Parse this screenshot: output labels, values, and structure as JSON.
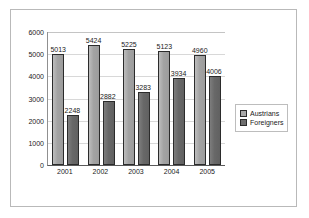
{
  "chart_data": {
    "type": "bar",
    "title": "",
    "subtitle": "",
    "xlabel": "",
    "ylabel": "",
    "categories": [
      "2001",
      "2002",
      "2003",
      "2004",
      "2005"
    ],
    "series": [
      {
        "name": "Austrians",
        "color": "#a8a8a8",
        "values": [
          5013,
          5424,
          5225,
          5123,
          4960
        ],
        "labels": [
          "5013",
          "5424",
          "5225",
          "5123",
          "4960"
        ]
      },
      {
        "name": "Foreigners",
        "color": "#6e6e6e",
        "values": [
          2248,
          2882,
          3283,
          3934,
          4006
        ],
        "labels": [
          "2248",
          "2882",
          "3283",
          "3934",
          "4006"
        ]
      }
    ],
    "ylim": [
      0,
      6000
    ],
    "ytick_values": [
      0,
      1000,
      2000,
      3000,
      4000,
      5000,
      6000
    ],
    "ytick_labels": [
      "0",
      "1000",
      "2000",
      "3000",
      "4000",
      "5000",
      "6000"
    ],
    "grid": true,
    "grid_axis": "y",
    "legend_position": "right",
    "legend_entries": [
      "Austrians",
      "Foreigners"
    ]
  }
}
